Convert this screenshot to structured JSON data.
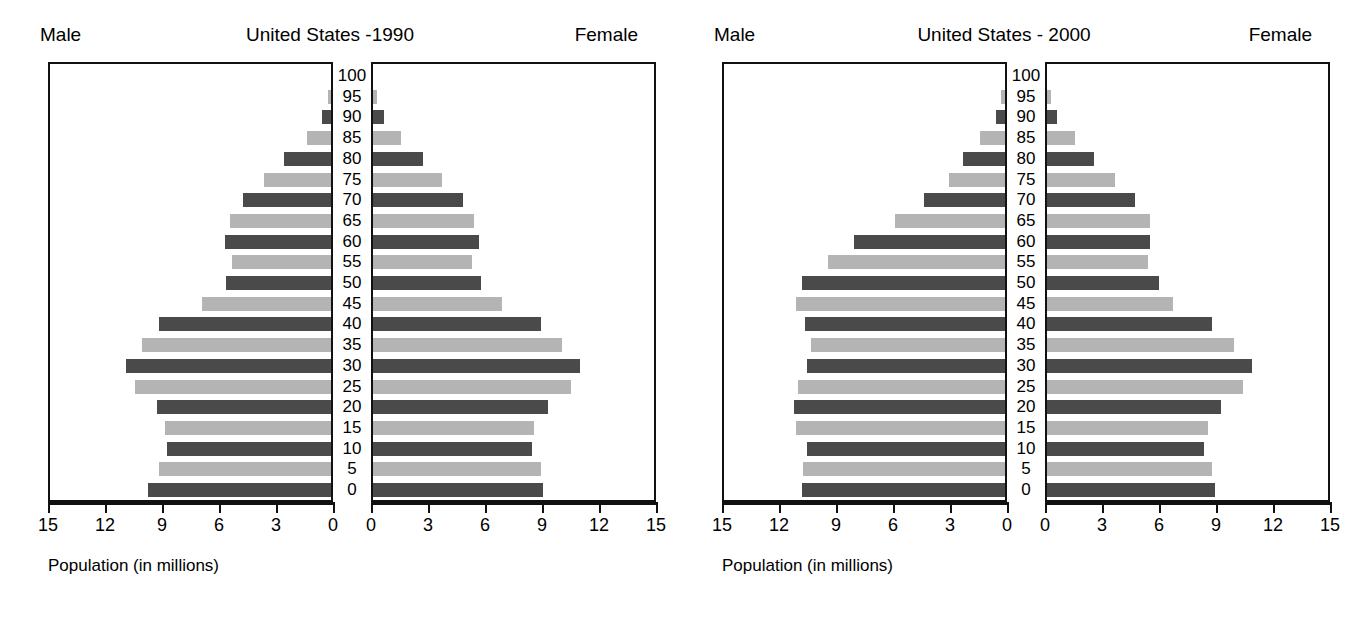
{
  "chart_data": [
    {
      "type": "bar",
      "subtype": "population-pyramid",
      "title": "United States -1990",
      "left_label": "Male",
      "right_label": "Female",
      "xlabel": "Population (in millions)",
      "ylabel": "",
      "categories": [
        0,
        5,
        10,
        15,
        20,
        25,
        30,
        35,
        40,
        45,
        50,
        55,
        60,
        65,
        70,
        75,
        80,
        85,
        90,
        95,
        100
      ],
      "category_labels": [
        "0",
        "5",
        "10",
        "15",
        "20",
        "25",
        "30",
        "35",
        "40",
        "45",
        "50",
        "55",
        "60",
        "65",
        "70",
        "75",
        "80",
        "85",
        "90",
        "95",
        "100"
      ],
      "xticks": [
        15,
        12,
        9,
        6,
        3,
        0,
        0,
        3,
        6,
        9,
        12,
        15
      ],
      "xlim": [
        0,
        15
      ],
      "grid": false,
      "legend": "none",
      "series": [
        {
          "name": "Male",
          "side": "left",
          "values": [
            9.8,
            9.2,
            8.8,
            8.9,
            9.3,
            10.5,
            11.0,
            10.1,
            9.2,
            6.9,
            5.6,
            5.3,
            5.7,
            5.4,
            4.7,
            3.6,
            2.5,
            1.3,
            0.5,
            0.15,
            0.0
          ]
        },
        {
          "name": "Female",
          "side": "right",
          "values": [
            9.1,
            9.0,
            8.5,
            8.6,
            9.4,
            10.6,
            11.1,
            10.1,
            9.0,
            6.9,
            5.8,
            5.3,
            5.7,
            5.4,
            4.8,
            3.7,
            2.7,
            1.5,
            0.6,
            0.2,
            0.0
          ]
        }
      ]
    },
    {
      "type": "bar",
      "subtype": "population-pyramid",
      "title": "United States - 2000",
      "left_label": "Male",
      "right_label": "Female",
      "xlabel": "Population (in millions)",
      "ylabel": "",
      "categories": [
        0,
        5,
        10,
        15,
        20,
        25,
        30,
        35,
        40,
        45,
        50,
        55,
        60,
        65,
        70,
        75,
        80,
        85,
        90,
        95,
        100
      ],
      "category_labels": [
        "0",
        "5",
        "10",
        "15",
        "20",
        "25",
        "30",
        "35",
        "40",
        "45",
        "50",
        "55",
        "60",
        "65",
        "70",
        "75",
        "80",
        "85",
        "90",
        "95",
        "100"
      ],
      "xticks": [
        15,
        12,
        9,
        6,
        3,
        0,
        0,
        3,
        6,
        9,
        12,
        15
      ],
      "xlim": [
        0,
        15
      ],
      "grid": false,
      "legend": "none",
      "series": [
        {
          "name": "Male",
          "side": "left",
          "values": [
            10.9,
            10.8,
            10.6,
            11.2,
            11.3,
            11.1,
            10.6,
            10.4,
            10.7,
            11.2,
            10.9,
            9.5,
            8.1,
            5.9,
            4.35,
            3.0,
            2.25,
            1.35,
            0.5,
            0.2,
            0.0
          ]
        },
        {
          "name": "Female",
          "side": "right",
          "values": [
            9.0,
            8.85,
            8.4,
            8.6,
            9.3,
            10.5,
            11.0,
            10.0,
            8.85,
            6.75,
            6.0,
            5.4,
            5.5,
            5.5,
            4.7,
            3.65,
            2.5,
            1.5,
            0.55,
            0.2,
            0.0
          ]
        }
      ]
    }
  ],
  "colors": {
    "bar_dark": "#4a4a4a",
    "bar_light": "#b4b4b4",
    "axis": "#111111",
    "background": "#ffffff"
  },
  "panels": [
    {
      "id": "us-1990",
      "male_label": "Male",
      "female_label": "Female",
      "title": "United States -1990",
      "axis_title": "Population (in millions)",
      "tick_labels_left": [
        "15",
        "12",
        "9",
        "6",
        "3",
        "0"
      ],
      "tick_labels_right": [
        "0",
        "3",
        "6",
        "9",
        "12",
        "15"
      ],
      "age_labels": [
        "100",
        "95",
        "90",
        "85",
        "80",
        "75",
        "70",
        "65",
        "60",
        "55",
        "50",
        "45",
        "40",
        "35",
        "30",
        "25",
        "20",
        "15",
        "10",
        "5",
        "0"
      ]
    },
    {
      "id": "us-2000",
      "male_label": "Male",
      "female_label": "Female",
      "title": "United States - 2000",
      "axis_title": "Population (in millions)",
      "tick_labels_left": [
        "15",
        "12",
        "9",
        "6",
        "3",
        "0"
      ],
      "tick_labels_right": [
        "0",
        "3",
        "6",
        "9",
        "12",
        "15"
      ],
      "age_labels": [
        "100",
        "95",
        "90",
        "85",
        "80",
        "75",
        "70",
        "65",
        "60",
        "55",
        "50",
        "45",
        "40",
        "35",
        "30",
        "25",
        "20",
        "15",
        "10",
        "5",
        "0"
      ]
    }
  ]
}
